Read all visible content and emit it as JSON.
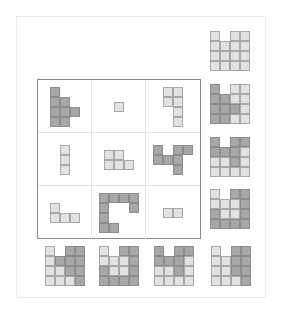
{
  "puzzle": {
    "matrix": {
      "rows": 3,
      "cols": 3,
      "cells": [
        {
          "r": 0,
          "c": 0,
          "shade": "d",
          "squares": [
            [
              0,
              0
            ],
            [
              0,
              1
            ],
            [
              1,
              1
            ],
            [
              0,
              2
            ],
            [
              1,
              2
            ],
            [
              2,
              2
            ],
            [
              0,
              3
            ],
            [
              1,
              3
            ]
          ]
        },
        {
          "r": 0,
          "c": 1,
          "shade": "l",
          "squares": [
            [
              0,
              0
            ]
          ]
        },
        {
          "r": 0,
          "c": 2,
          "shade": "l",
          "squares": [
            [
              0,
              0
            ],
            [
              1,
              0
            ],
            [
              0,
              1
            ],
            [
              1,
              1
            ],
            [
              1,
              2
            ],
            [
              1,
              3
            ]
          ]
        },
        {
          "r": 1,
          "c": 0,
          "shade": "l",
          "squares": [
            [
              0,
              0
            ],
            [
              0,
              1
            ],
            [
              0,
              2
            ]
          ]
        },
        {
          "r": 1,
          "c": 1,
          "shade": "l",
          "squares": [
            [
              0,
              0
            ],
            [
              1,
              0
            ],
            [
              0,
              1
            ],
            [
              1,
              1
            ],
            [
              2,
              1
            ]
          ]
        },
        {
          "r": 1,
          "c": 2,
          "shade": "d",
          "squares": [
            [
              0,
              0
            ],
            [
              2,
              0
            ],
            [
              3,
              0
            ],
            [
              0,
              1
            ],
            [
              1,
              1
            ],
            [
              2,
              1
            ],
            [
              2,
              2
            ]
          ]
        },
        {
          "r": 2,
          "c": 0,
          "shade": "l",
          "squares": [
            [
              0,
              0
            ],
            [
              0,
              1
            ],
            [
              1,
              1
            ],
            [
              2,
              1
            ]
          ]
        },
        {
          "r": 2,
          "c": 1,
          "shade": "d",
          "squares": [
            [
              0,
              0
            ],
            [
              1,
              0
            ],
            [
              2,
              0
            ],
            [
              3,
              0
            ],
            [
              0,
              1
            ],
            [
              3,
              1
            ],
            [
              0,
              2
            ],
            [
              0,
              3
            ],
            [
              1,
              3
            ]
          ]
        },
        {
          "r": 2,
          "c": 2,
          "shade": "l",
          "squares": [
            [
              0,
              0
            ],
            [
              1,
              0
            ]
          ]
        }
      ]
    },
    "right_candidates": [
      {
        "grid": [
          "L.LL",
          "LLLL",
          "LLLL",
          "LLLL"
        ]
      },
      {
        "grid": [
          "D.LL",
          "DDLL",
          "DDDL",
          "DDLL"
        ]
      },
      {
        "grid": [
          "D.DD",
          "DDDL",
          "LLDL",
          "LLLL"
        ]
      },
      {
        "grid": [
          "L.DD",
          "LLLD",
          "DLLD",
          "DDDD"
        ]
      }
    ],
    "bottom_candidates": [
      {
        "grid": [
          "L.DD",
          "LDDD",
          "LLDD",
          "LLLD"
        ]
      },
      {
        "grid": [
          "L.DD",
          "LLLD",
          "DLLD",
          "DDDD"
        ]
      },
      {
        "grid": [
          "D.DD",
          "DDDL",
          "LLDL",
          "LLLL"
        ]
      },
      {
        "grid": [
          "L.DD",
          "LLDD",
          "LLDD",
          "LLLD"
        ]
      }
    ]
  }
}
